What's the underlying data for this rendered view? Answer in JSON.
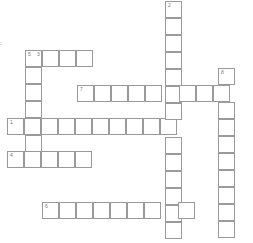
{
  "puzzle": {
    "cell_size": 17,
    "border_color": "#9a9a9a",
    "stray_char": ":",
    "words": [
      {
        "number": "1",
        "direction": "across",
        "x": 7,
        "y": 118,
        "length": 10
      },
      {
        "number": "2",
        "direction": "down",
        "x": 165,
        "y": 1,
        "length": 14
      },
      {
        "number": "3",
        "direction": "across",
        "x": 25,
        "y": 50,
        "length": 4
      },
      {
        "number": "4",
        "direction": "across",
        "x": 7,
        "y": 151,
        "length": 5
      },
      {
        "number": "5",
        "direction": "down",
        "x": 25,
        "y": 50,
        "length": 7
      },
      {
        "number": "6",
        "direction": "across",
        "x": 42,
        "y": 202,
        "length": 9
      },
      {
        "number": "7",
        "direction": "across",
        "x": 77,
        "y": 85,
        "length": 9
      },
      {
        "number": "8",
        "direction": "down",
        "x": 218,
        "y": 68,
        "length": 10
      }
    ],
    "labels": [
      {
        "cell": [
          25,
          50
        ],
        "texts": [
          "5",
          "3"
        ]
      },
      {
        "cell": [
          165,
          1
        ],
        "texts": [
          "2"
        ]
      },
      {
        "cell": [
          77,
          85
        ],
        "texts": [
          "7"
        ]
      },
      {
        "cell": [
          218,
          68
        ],
        "texts": [
          "8"
        ]
      },
      {
        "cell": [
          7,
          118
        ],
        "texts": [
          "1"
        ]
      },
      {
        "cell": [
          7,
          151
        ],
        "texts": [
          "4"
        ]
      },
      {
        "cell": [
          42,
          202
        ],
        "texts": [
          "6"
        ]
      }
    ]
  }
}
